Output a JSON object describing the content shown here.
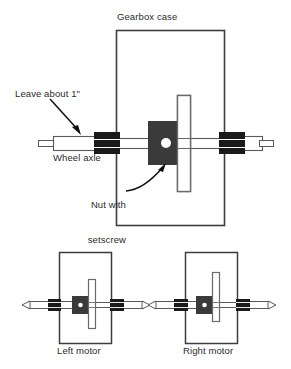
{
  "figure": {
    "type": "technical-assembly-diagram",
    "background_color": "#ffffff"
  },
  "colors": {
    "outline": "#555555",
    "dark_block": "#1a1a1a",
    "nut_block": "#3a3a3a",
    "setscrew_hole": "#ffffff",
    "case_border": "#3d3d3d",
    "text": "#2b2b2b",
    "arrow": "#111111"
  },
  "labels": {
    "gearbox_case": "Gearbox case",
    "leave_about": "Leave about 1\"",
    "wheel_axle": "Wheel axle",
    "nut_with_setscrew_line1": "Nut with",
    "nut_with_setscrew_line2": "setscrew",
    "left_motor": "Left motor",
    "right_motor": "Right motor"
  },
  "main_view": {
    "case": {
      "x": 116,
      "y": 30,
      "width": 108,
      "height": 195
    },
    "axle": {
      "y_center": 143,
      "x_start": 38,
      "x_end": 253
    },
    "nut": {
      "x": 148,
      "y": 121,
      "width": 38,
      "height": 44
    },
    "setscrew_circle": {
      "cx": 166,
      "cy": 143,
      "r": 5
    },
    "gear_disc": {
      "x": 177,
      "y": 95,
      "width": 14,
      "height": 96
    },
    "collars": [
      {
        "x": 94,
        "y": 132,
        "width": 26,
        "height": 22
      },
      {
        "x": 219,
        "y": 132,
        "width": 26,
        "height": 22
      }
    ]
  },
  "bottom_views": [
    {
      "name": "left-motor",
      "case": {
        "x": 59,
        "y": 252,
        "width": 52,
        "height": 91
      },
      "axle_y": 305,
      "nut": {
        "x": 72,
        "y": 296,
        "width": 17,
        "height": 18
      },
      "gear_disc": {
        "x": 88,
        "y": 279,
        "width": 7,
        "height": 49
      }
    },
    {
      "name": "right-motor",
      "case": {
        "x": 185,
        "y": 252,
        "width": 52,
        "height": 91
      },
      "axle_y": 305,
      "nut": {
        "x": 196,
        "y": 296,
        "width": 17,
        "height": 18
      },
      "gear_disc": {
        "x": 212,
        "y": 272,
        "width": 7,
        "height": 49
      }
    }
  ],
  "annotations": [
    {
      "name": "leave-about-arrow",
      "style": "straight",
      "from": [
        52,
        100
      ],
      "to": [
        80,
        132
      ]
    },
    {
      "name": "nut-setscrew-arrow",
      "style": "curved",
      "from": [
        128,
        192
      ],
      "to": [
        166,
        164
      ]
    }
  ]
}
